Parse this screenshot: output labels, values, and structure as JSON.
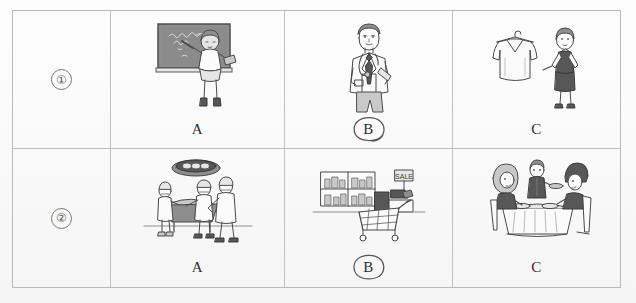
{
  "worksheet": {
    "rows": [
      {
        "number": "①",
        "number_plain": "1",
        "options": [
          {
            "letter": "A",
            "selected": false,
            "illustration": "teacher-at-blackboard",
            "illustration_text": ""
          },
          {
            "letter": "B",
            "selected": true,
            "illustration": "doctor-with-stethoscope",
            "illustration_text": ""
          },
          {
            "letter": "C",
            "selected": false,
            "illustration": "shop-assistant-with-clothes-hanger",
            "illustration_text": ""
          }
        ]
      },
      {
        "number": "②",
        "number_plain": "2",
        "options": [
          {
            "letter": "A",
            "selected": false,
            "illustration": "surgeons-in-operating-room",
            "illustration_text": ""
          },
          {
            "letter": "B",
            "selected": true,
            "illustration": "supermarket-with-shopping-cart",
            "illustration_text": "SALE"
          },
          {
            "letter": "C",
            "selected": false,
            "illustration": "waiter-serving-couple-at-restaurant",
            "illustration_text": ""
          }
        ]
      }
    ]
  },
  "colors": {
    "ink": "#4a4a4a",
    "border": "#bdbdbd",
    "paper": "#fdfdfd",
    "pen_mark": "#555555"
  }
}
